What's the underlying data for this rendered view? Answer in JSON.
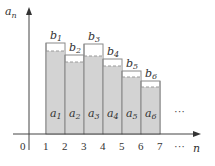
{
  "axes": {
    "y_label": "a",
    "y_label_sub": "n",
    "x_label": "n",
    "origin_label": "0",
    "x_ticks": [
      "1",
      "2",
      "3",
      "4",
      "5",
      "6",
      "7"
    ],
    "x_ellipsis": "···"
  },
  "bars": [
    {
      "a_label": "a",
      "a_sub": "1",
      "b_label": "b",
      "b_sub": "1",
      "b_top": 43,
      "a_top": 51
    },
    {
      "a_label": "a",
      "a_sub": "2",
      "b_label": "b",
      "b_sub": "2",
      "b_top": 55,
      "a_top": 62
    },
    {
      "a_label": "a",
      "a_sub": "3",
      "b_label": "b",
      "b_sub": "3",
      "b_top": 44,
      "a_top": 56
    },
    {
      "a_label": "a",
      "a_sub": "4",
      "b_label": "b",
      "b_sub": "4",
      "b_top": 59,
      "a_top": 66
    },
    {
      "a_label": "a",
      "a_sub": "5",
      "b_label": "b",
      "b_sub": "5",
      "b_top": 71,
      "a_top": 77
    },
    {
      "a_label": "a",
      "a_sub": "6",
      "b_label": "b",
      "b_sub": "6",
      "b_top": 81,
      "a_top": 87
    }
  ],
  "area_ellipsis": "···",
  "colors": {
    "bar_fill": "#d3d3d3",
    "bar_outline": "#8a8a8a",
    "dash": "#9a9a9a",
    "axis": "#444444"
  }
}
